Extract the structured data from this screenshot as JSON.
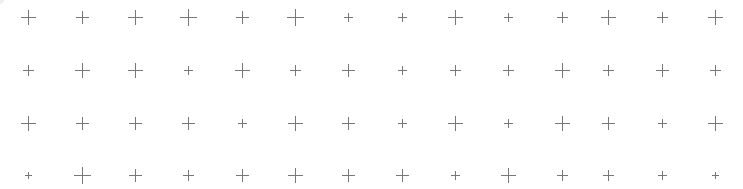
{
  "canvas": {
    "width": 743,
    "height": 189,
    "background": "#ffffff"
  },
  "grid": {
    "color": "#777777",
    "column_x": [
      28,
      82,
      135,
      188,
      242,
      295,
      348,
      402,
      455,
      508,
      562,
      608,
      662,
      715
    ],
    "row_y": [
      17,
      70,
      123,
      175
    ],
    "arm_half_lengths": [
      [
        7,
        6,
        7,
        8,
        6,
        8,
        4,
        4,
        7,
        4,
        5,
        7,
        5,
        7
      ],
      [
        5,
        7,
        7,
        4,
        7,
        5,
        6,
        4,
        5,
        5,
        7,
        5,
        6,
        5
      ],
      [
        7,
        6,
        6,
        6,
        4,
        7,
        6,
        4,
        7,
        4,
        7,
        6,
        4,
        7
      ],
      [
        3,
        8,
        6,
        5,
        6,
        7,
        6,
        6,
        4,
        7,
        5,
        5,
        4,
        3
      ]
    ]
  }
}
